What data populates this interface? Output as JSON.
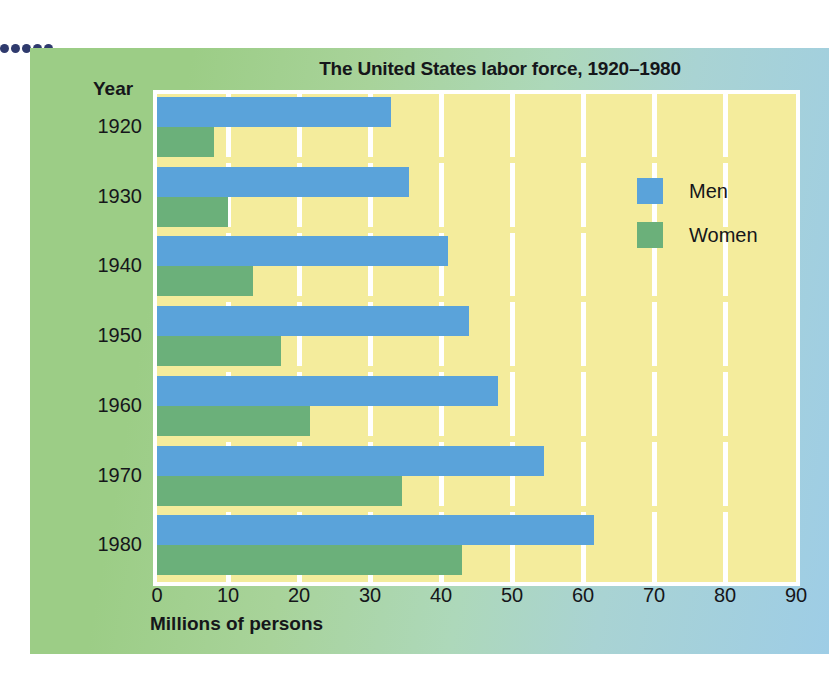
{
  "figure": {
    "title": "The United States labor force, 1920–1980",
    "year_axis_header": "Year",
    "x_axis_title": "Millions of persons"
  },
  "legend": {
    "position": "inside-plot-upper-right",
    "entries": [
      {
        "label": "Men",
        "color": "#5aa3da",
        "icon": "color-swatch"
      },
      {
        "label": "Women",
        "color": "#6bb07a",
        "icon": "color-swatch"
      }
    ]
  },
  "palette": {
    "men": "#5aa3da",
    "women": "#6bb07a",
    "plot_background": "#f4ec9c",
    "gridline": "#ffffff",
    "panel_left": "#9ccd86",
    "panel_right": "#9ecde6",
    "text": "#15161a",
    "dot_rule": "#2f3a6d"
  },
  "chart_data": {
    "type": "bar",
    "orientation": "horizontal",
    "title": "The United States labor force, 1920–1980",
    "xlabel": "Millions of persons",
    "ylabel": "Year",
    "xlim": [
      0,
      90
    ],
    "xticks": [
      0,
      10,
      20,
      30,
      40,
      50,
      60,
      70,
      80,
      90
    ],
    "xticklabels": [
      "0",
      "10",
      "20",
      "30",
      "40",
      "50",
      "60",
      "70",
      "80",
      "90"
    ],
    "categories": [
      "1920",
      "1930",
      "1940",
      "1950",
      "1960",
      "1970",
      "1980"
    ],
    "grid": "vertical-only",
    "series": [
      {
        "name": "Men",
        "color": "#5aa3da",
        "values": [
          33,
          35.5,
          41,
          44,
          48,
          54.5,
          61.5
        ]
      },
      {
        "name": "Women",
        "color": "#6bb07a",
        "values": [
          8,
          10,
          13.5,
          17.5,
          21.5,
          34.5,
          43
        ]
      }
    ]
  }
}
